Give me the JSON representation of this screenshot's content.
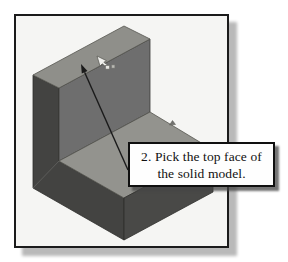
{
  "figure": {
    "type": "cad-tutorial-illustration",
    "frame": {
      "background": "#f5f5f3",
      "border_color": "#1b1b1b",
      "shadow_color": "#b9b9b9"
    },
    "callout": {
      "line1": "2. Pick the top face of",
      "line2": "the solid model.",
      "background": "#fefefe",
      "border_color": "#101010",
      "text_color": "#111111"
    },
    "model": {
      "description": "L-shaped solid block in isometric view",
      "faces": {
        "wall_top": "#8f8f8a",
        "wall_front": "#6e6e6e",
        "left_end_cap": "#434341",
        "base_top": "#93938e",
        "base_front": "#494947"
      },
      "edge_color": "#2e2e2c",
      "seam_color": "#5f5f5c"
    },
    "annotation_arrow": {
      "color": "#1a1a1a"
    },
    "icons": {
      "cursor": "select-cursor-icon",
      "edge_marker": "edge-marker-icon"
    }
  }
}
